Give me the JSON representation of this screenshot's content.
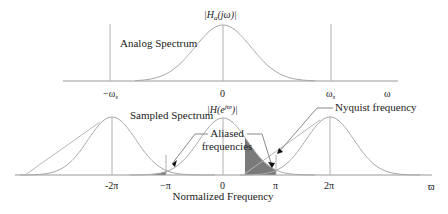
{
  "diagram": {
    "top": {
      "title": "Analog Spectrum",
      "magnitude_label": "|H",
      "magnitude_sub": "a",
      "magnitude_arg": "(jω)|",
      "ticks": [
        {
          "label": "−ω",
          "sub": "s",
          "pos": "-ws"
        },
        {
          "label": "0",
          "sub": "",
          "pos": "0"
        },
        {
          "label": "ω",
          "sub": "s",
          "pos": "ws"
        }
      ],
      "axis_label": "ω"
    },
    "bottom": {
      "title": "Sampled Spectrum",
      "magnitude_label": "|H(e",
      "magnitude_sup": "jϖ",
      "magnitude_close": ")|",
      "ticks": [
        {
          "label": "-2π",
          "pos": "-2pi"
        },
        {
          "label": "−π",
          "pos": "-pi"
        },
        {
          "label": "0",
          "pos": "0"
        },
        {
          "label": "π",
          "pos": "pi"
        },
        {
          "label": "2π",
          "pos": "2pi"
        }
      ],
      "axis_label": "ϖ",
      "xlabel": "Normalized Frequency",
      "annotations": {
        "aliased_line1": "Aliased",
        "aliased_line2": "frequencies",
        "nyquist": "Nyquist frequency"
      }
    },
    "colors": {
      "curve": "#a8a8a8",
      "axis": "#9a9a9a",
      "shade": "#7a7a7a",
      "text": "#222222",
      "arrow": "#111111"
    }
  }
}
